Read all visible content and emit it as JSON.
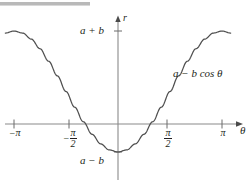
{
  "figure": {
    "name": "cardioid-limacon-rectangular-graph",
    "background_color": "#ffffff",
    "ink_color": "#231f20",
    "axis_color": "#8a8a8a",
    "top_rule_color": "#b9b9b9"
  },
  "labels": {
    "y_axis": "r",
    "x_axis": "θ",
    "max_value": "a + b",
    "min_value": "a − b",
    "curve": "a − b cos θ"
  },
  "ticks": {
    "x": [
      {
        "id": "neg-pi",
        "neg": "−",
        "text": "π",
        "numerator": null,
        "denominator": null,
        "value": -3.14159
      },
      {
        "id": "neg-half-pi",
        "neg": "−",
        "text": null,
        "numerator": "π",
        "denominator": "2",
        "value": -1.5708
      },
      {
        "id": "half-pi",
        "neg": "",
        "text": null,
        "numerator": "π",
        "denominator": "2",
        "value": 1.5708
      },
      {
        "id": "pi",
        "neg": "",
        "text": "π",
        "numerator": null,
        "denominator": null,
        "value": 3.14159
      }
    ],
    "y": [
      {
        "id": "a-plus-b",
        "label": "a + b"
      },
      {
        "id": "a-minus-b",
        "label": "a − b"
      }
    ]
  },
  "chart_data": {
    "type": "line",
    "title": "",
    "subtitle": "",
    "xlabel": "θ",
    "ylabel": "r",
    "grid": false,
    "legend": null,
    "xlim": [
      -3.6,
      3.6
    ],
    "ylim_labels": [
      "a − b",
      "a + b"
    ],
    "xtick_values": [
      -3.14159,
      -1.5708,
      1.5708,
      3.14159
    ],
    "xtick_labels": [
      "−π",
      "−π/2",
      "π/2",
      "π"
    ],
    "ytick_values": [
      -1,
      1
    ],
    "ytick_labels": [
      "a − b",
      "a + b"
    ],
    "series": [
      {
        "name": "a − b cos θ",
        "formula": "r = a - b*cos(theta)",
        "annotation": "a − b cos θ",
        "x": [
          -3.40339,
          -3.14159,
          -2.87979,
          -2.61799,
          -2.35619,
          -2.0944,
          -1.8326,
          -1.5708,
          -1.309,
          -1.0472,
          -0.7854,
          -0.5236,
          -0.2618,
          0,
          0.2618,
          0.5236,
          0.7854,
          1.0472,
          1.309,
          1.5708,
          1.8326,
          2.0944,
          2.35619,
          2.61799,
          2.87979,
          3.14159,
          3.40339
        ],
        "y_normalized": [
          0.96593,
          1,
          0.96593,
          0.86603,
          0.70711,
          0.5,
          0.25882,
          0,
          -0.25882,
          -0.5,
          -0.70711,
          -0.86603,
          -0.96593,
          -1,
          -0.96593,
          -0.86603,
          -0.70711,
          -0.5,
          -0.25882,
          0,
          0.25882,
          0.5,
          0.70711,
          0.86603,
          0.96593,
          1,
          0.96593
        ],
        "note": "y_normalized = -cos(theta); maps to a+b at +1 and a-b at -1"
      }
    ]
  }
}
